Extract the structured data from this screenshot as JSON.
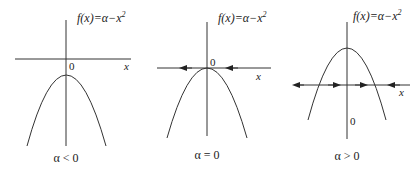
{
  "figure": {
    "panels": [
      {
        "id": "alpha-negative",
        "function_label": {
          "prefix": "f(x)=α−x",
          "exp": "2"
        },
        "origin_label": "0",
        "x_axis_label": "x",
        "caption": "α < 0",
        "arrows": []
      },
      {
        "id": "alpha-zero",
        "function_label": {
          "prefix": "f(x)=α−x",
          "exp": "2"
        },
        "origin_label": "0",
        "x_axis_label": "x",
        "caption": "α = 0",
        "arrows": [
          "left",
          "left"
        ]
      },
      {
        "id": "alpha-positive",
        "function_label": {
          "prefix": "f(x)=α−x",
          "exp": "2"
        },
        "origin_label": "0",
        "x_axis_label": "x",
        "caption": "α > 0",
        "arrows": [
          "left",
          "right",
          "right",
          "left"
        ]
      }
    ],
    "colors": {
      "line": "#333333",
      "text": "#222222",
      "background": "#ffffff"
    }
  }
}
